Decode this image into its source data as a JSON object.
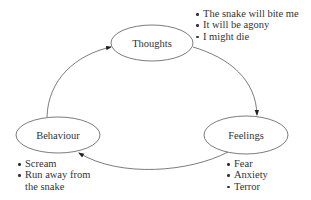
{
  "diagram": {
    "type": "cycle",
    "nodes": [
      {
        "id": "thoughts",
        "label": "Thoughts",
        "items": [
          "The snake will bite me",
          "It will be agony",
          "I might die"
        ]
      },
      {
        "id": "feelings",
        "label": "Feelings",
        "items": [
          "Fear",
          "Anxiety",
          "Terror"
        ]
      },
      {
        "id": "behaviour",
        "label": "Behaviour",
        "items": [
          "Scream",
          "Run away from",
          "the snake"
        ]
      }
    ],
    "edges": [
      {
        "from": "thoughts",
        "to": "feelings"
      },
      {
        "from": "feelings",
        "to": "behaviour"
      },
      {
        "from": "behaviour",
        "to": "thoughts"
      }
    ],
    "colors": {
      "stroke": "#333333",
      "text": "#333333",
      "background": "#ffffff"
    }
  }
}
